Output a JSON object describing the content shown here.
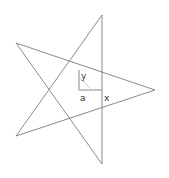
{
  "diagram": {
    "type": "pentagram",
    "colors": {
      "line": "#8a8a8a",
      "diagonal": "#c8c8c8",
      "label": "#333333",
      "background": "#ffffff"
    },
    "vertices": {
      "top": [
        102,
        15
      ],
      "upper_left": [
        16,
        43
      ],
      "right": [
        155,
        90
      ],
      "lower_left": [
        16,
        136
      ],
      "bottom": [
        102,
        164
      ]
    },
    "labels": {
      "y": "y",
      "a": "a",
      "x": "x"
    }
  }
}
